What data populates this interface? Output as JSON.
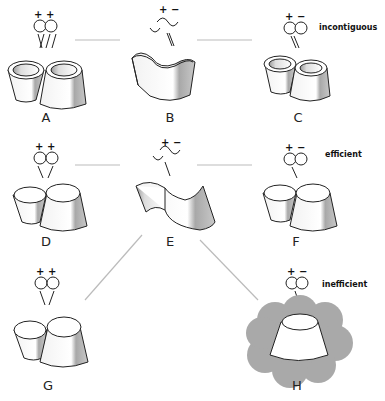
{
  "categories": [
    {
      "id": "row1",
      "label": "incontiguous"
    },
    {
      "id": "row2",
      "label": "efficient"
    },
    {
      "id": "row3",
      "label": "inefficient"
    }
  ],
  "panels": [
    {
      "id": "A",
      "label": "A",
      "charges": [
        "+",
        "+"
      ]
    },
    {
      "id": "B",
      "label": "B",
      "charges": [
        "+",
        "−"
      ]
    },
    {
      "id": "C",
      "label": "C",
      "charges": [
        "+",
        "−"
      ]
    },
    {
      "id": "D",
      "label": "D",
      "charges": [
        "+",
        "+"
      ]
    },
    {
      "id": "E",
      "label": "E",
      "charges": [
        "+",
        "−"
      ]
    },
    {
      "id": "F",
      "label": "F",
      "charges": [
        "+",
        "−"
      ]
    },
    {
      "id": "G",
      "label": "G",
      "charges": [
        "+",
        "+"
      ]
    },
    {
      "id": "H",
      "label": "H",
      "charges": [
        "+",
        "−"
      ]
    }
  ],
  "colors": {
    "line": "#bbbbbb",
    "shade": "#a8a8a8",
    "cloud": "#a9a9a9",
    "stroke": "#222222"
  }
}
